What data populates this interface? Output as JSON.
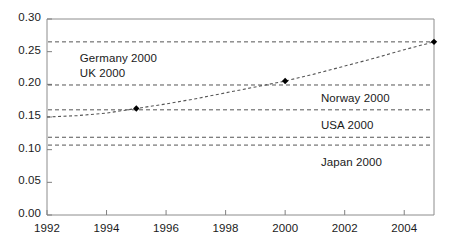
{
  "chart_data": {
    "type": "line",
    "title": "",
    "subtitle": "",
    "xlabel": "",
    "ylabel": "",
    "xlim": [
      1992,
      2005
    ],
    "ylim": [
      0.0,
      0.3
    ],
    "grid": false,
    "legend_position": "none",
    "x_ticks": [
      1992,
      1994,
      1996,
      1998,
      2000,
      2002,
      2004
    ],
    "x_tick_labels": [
      "1992",
      "1994",
      "1996",
      "1998",
      "2000",
      "2002",
      "2004"
    ],
    "y_ticks": [
      0.0,
      0.05,
      0.1,
      0.15,
      0.2,
      0.25,
      0.3
    ],
    "y_tick_labels": [
      "0.00",
      "0.05",
      "0.10",
      "0.15",
      "0.20",
      "0.25",
      "0.30"
    ],
    "series": [
      {
        "name": "trend",
        "style": "dashed",
        "color": "#555555",
        "x": [
          1992,
          1993,
          1994,
          1995,
          1996,
          1997,
          1998,
          1999,
          2000,
          2001,
          2002,
          2003,
          2004,
          2005
        ],
        "y": [
          0.15,
          0.152,
          0.156,
          0.163,
          0.17,
          0.178,
          0.187,
          0.196,
          0.205,
          0.216,
          0.228,
          0.24,
          0.253,
          0.265
        ],
        "markers": [
          {
            "x": 1995,
            "y": 0.163
          },
          {
            "x": 2000,
            "y": 0.205
          },
          {
            "x": 2005,
            "y": 0.265
          }
        ]
      }
    ],
    "reference_lines": [
      {
        "label": "Germany 2000",
        "value": 0.265,
        "style": "dashed",
        "color": "#555555",
        "label_x": 1993.1,
        "label_dy": 17
      },
      {
        "label": "UK 2000",
        "value": 0.199,
        "style": "dashed",
        "color": "#555555",
        "label_x": 1993.1,
        "label_dy": -11
      },
      {
        "label": "Norway 2000",
        "value": 0.161,
        "style": "dashed",
        "color": "#555555",
        "label_x": 2001.2,
        "label_dy": -11
      },
      {
        "label": "USA 2000",
        "value": 0.119,
        "style": "dashed",
        "color": "#555555",
        "label_x": 2001.2,
        "label_dy": -11
      },
      {
        "label": "Japan 2000",
        "value": 0.107,
        "style": "dashed",
        "color": "#555555",
        "label_x": 2001.2,
        "label_dy": 18
      }
    ],
    "annotations": [
      "Germany 2000",
      "UK 2000",
      "Norway 2000",
      "USA 2000",
      "Japan 2000"
    ]
  },
  "axes": {
    "y_labels": [
      "0.30",
      "0.25",
      "0.20",
      "0.15",
      "0.10",
      "0.05",
      "0.00"
    ],
    "x_labels": [
      "1992",
      "1994",
      "1996",
      "1998",
      "2000",
      "2002",
      "2004"
    ]
  },
  "colors": {
    "axis": "#808080",
    "line": "#555555",
    "marker": "#000000",
    "text": "#1a1a1a",
    "background": "#ffffff"
  }
}
